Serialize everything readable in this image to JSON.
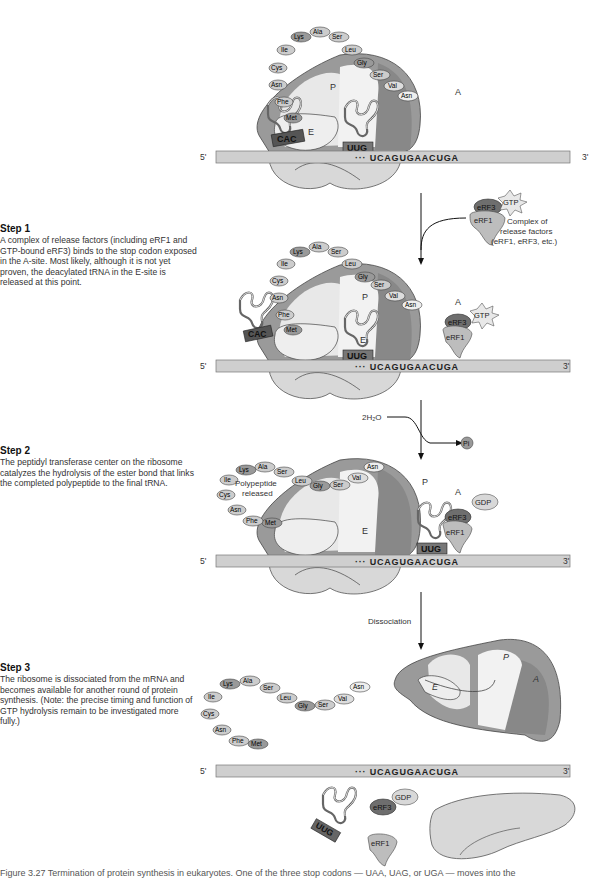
{
  "figure": {
    "strand": {
      "five_prime": "5'",
      "three_prime": "3'",
      "sequence": "··· UCAGUGAACUGA"
    },
    "sites": {
      "e": "E",
      "p": "P",
      "a": "A"
    },
    "codons": {
      "p_anticodon": "UUG",
      "e_anticodon": "CAC"
    },
    "polypeptide": [
      "Met",
      "Phe",
      "Asn",
      "Cys",
      "Ile",
      "Lys",
      "Ala",
      "Ser",
      "Leu",
      "Gly",
      "Ser",
      "Val",
      "Asn"
    ],
    "factors": {
      "erf1": "eRF1",
      "erf3": "eRF3",
      "gtp": "GTP",
      "gdp": "GDP"
    },
    "complex_label": [
      "Complex of",
      "release factors",
      "(eRF1, eRF3, etc.)"
    ],
    "water_label": "2H₂O",
    "pi_label": "Pi",
    "polypeptide_released": [
      "Polypeptide",
      "released"
    ],
    "dissociation_label": "Dissociation"
  },
  "steps": [
    {
      "title": "Step 1",
      "text": "A complex of release factors (including eRF1 and GTP-bound eRF3) binds to the stop codon exposed in the A-site. Most likely, although it is not yet proven, the deacylated tRNA in the E-site is released at this point."
    },
    {
      "title": "Step 2",
      "text": "The peptidyl transferase center on the ribosome catalyzes the hydrolysis of the ester bond that links the completed polypeptide to the final tRNA."
    },
    {
      "title": "Step 3",
      "text": "The ribosome is dissociated from the mRNA and becomes available for another round of protein synthesis. (Note: the precise timing and function of GTP hydrolysis remain to be investigated more fully.)"
    }
  ],
  "caption": "Figure 3.27  Termination of protein synthesis in eukaryotes. One of the three stop codons — UAA, UAG, or UGA — moves into the",
  "colors": {
    "dark_gray": "#8a8a8a",
    "mid_gray": "#a9a9a9",
    "light": "#e6e6e6",
    "strand": "#cfcfcf",
    "erf3": "#6e6e6e"
  }
}
